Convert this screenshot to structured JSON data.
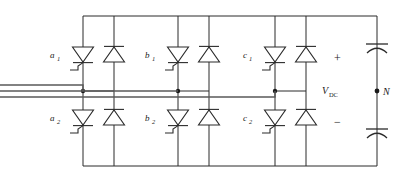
{
  "diagram": {
    "type": "circuit-schematic",
    "colors": {
      "wire": "#2b2b2b",
      "phase_wire": "#5a5a5a",
      "background": "#ffffff",
      "node": "#1a1a1a"
    },
    "legs": [
      {
        "id": "a",
        "phase_label": "a",
        "upper_switch_label": "a",
        "upper_switch_subscript": "1",
        "lower_switch_label": "a",
        "lower_switch_subscript": "2",
        "upper_device": "thyristor",
        "upper_antiparallel_device": "diode",
        "lower_device": "thyristor",
        "lower_antiparallel_device": "diode"
      },
      {
        "id": "b",
        "phase_label": "b",
        "upper_switch_label": "b",
        "upper_switch_subscript": "1",
        "lower_switch_label": "b",
        "lower_switch_subscript": "2",
        "upper_device": "thyristor",
        "upper_antiparallel_device": "diode",
        "lower_device": "thyristor",
        "lower_antiparallel_device": "diode"
      },
      {
        "id": "c",
        "phase_label": "c",
        "upper_switch_label": "c",
        "upper_switch_subscript": "1",
        "lower_switch_label": "c",
        "lower_switch_subscript": "2",
        "upper_device": "thyristor",
        "upper_antiparallel_device": "diode",
        "lower_device": "thyristor",
        "lower_antiparallel_device": "diode"
      }
    ],
    "dc_link": {
      "voltage_label": "V",
      "voltage_subscript": "DC",
      "positive_sign": "+",
      "negative_sign": "−",
      "neutral_label": "N",
      "upper_capacitor": "capacitor-upper",
      "lower_capacitor": "capacitor-lower"
    },
    "ac_input": {
      "line_count": 3,
      "lines": [
        "a",
        "b",
        "c"
      ]
    }
  }
}
